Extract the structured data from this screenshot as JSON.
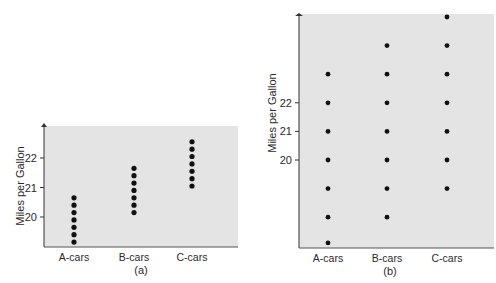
{
  "chart_data": [
    {
      "type": "scatter",
      "panel_label": "(a)",
      "title": "",
      "xlabel": "",
      "ylabel": "Miles per Gallon",
      "categories": [
        "A-cars",
        "B-cars",
        "C-cars"
      ],
      "yticks": [
        20,
        21,
        22
      ],
      "ylim": [
        19,
        23
      ],
      "grid": false,
      "background": "#e4e4e4",
      "series": [
        {
          "name": "A-cars",
          "values": [
            19.15,
            19.4,
            19.65,
            19.9,
            20.15,
            20.4,
            20.65
          ]
        },
        {
          "name": "B-cars",
          "values": [
            20.15,
            20.4,
            20.65,
            20.9,
            21.15,
            21.4,
            21.65
          ]
        },
        {
          "name": "C-cars",
          "values": [
            21.05,
            21.3,
            21.55,
            21.8,
            22.05,
            22.3,
            22.55
          ]
        }
      ]
    },
    {
      "type": "scatter",
      "panel_label": "(b)",
      "title": "",
      "xlabel": "",
      "ylabel": "Miles per Gallon",
      "categories": [
        "A-cars",
        "B-cars",
        "C-cars"
      ],
      "yticks": [
        20,
        21,
        22
      ],
      "ylim": [
        16.9,
        25.1
      ],
      "grid": false,
      "background": "#e4e4e4",
      "series": [
        {
          "name": "A-cars",
          "values": [
            17.1,
            18,
            19,
            20,
            21,
            22,
            23
          ]
        },
        {
          "name": "B-cars",
          "values": [
            18,
            19,
            20,
            21,
            22,
            23,
            24
          ]
        },
        {
          "name": "C-cars",
          "values": [
            19,
            20,
            21,
            22,
            23,
            24,
            25
          ]
        }
      ]
    }
  ],
  "panels": {
    "a": {
      "label": "(a)",
      "ylabel": "Miles per Gallon",
      "ticks": [
        "20",
        "21",
        "22"
      ],
      "categories": [
        "A-cars",
        "B-cars",
        "C-cars"
      ]
    },
    "b": {
      "label": "(b)",
      "ylabel": "Miles per Gallon",
      "ticks": [
        "20",
        "21",
        "22"
      ],
      "categories": [
        "A-cars",
        "B-cars",
        "C-cars"
      ]
    }
  }
}
